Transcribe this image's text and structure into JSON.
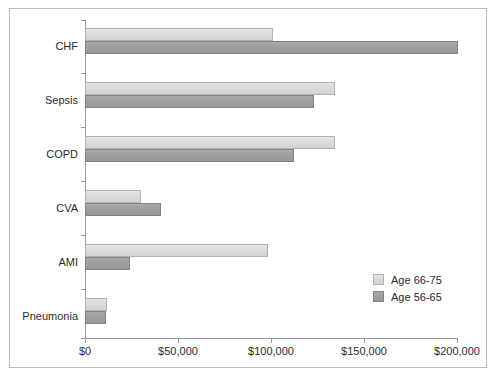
{
  "chart_data": {
    "type": "bar",
    "orientation": "horizontal",
    "title": "",
    "xlabel": "",
    "ylabel": "",
    "categories": [
      "CHF",
      "Sepsis",
      "COPD",
      "CVA",
      "AMI",
      "Pneumonia"
    ],
    "series": [
      {
        "name": "Age 66-75",
        "color": "#dcdcdc",
        "values": [
          101000,
          134000,
          134000,
          30000,
          98000,
          12000
        ]
      },
      {
        "name": "Age 56-65",
        "color": "#a0a0a0",
        "values": [
          200000,
          123000,
          112000,
          41000,
          24000,
          11000
        ]
      }
    ],
    "xlim": [
      0,
      200000
    ],
    "xticks": [
      0,
      50000,
      100000,
      150000,
      200000
    ],
    "xtick_labels": [
      "$0",
      "$50,000",
      "$100,000",
      "$150,000",
      "$200,000"
    ],
    "grid": false,
    "legend_position": "lower-right"
  },
  "legend": {
    "items": [
      {
        "label": "Age 66-75"
      },
      {
        "label": "Age 56-65"
      }
    ]
  }
}
